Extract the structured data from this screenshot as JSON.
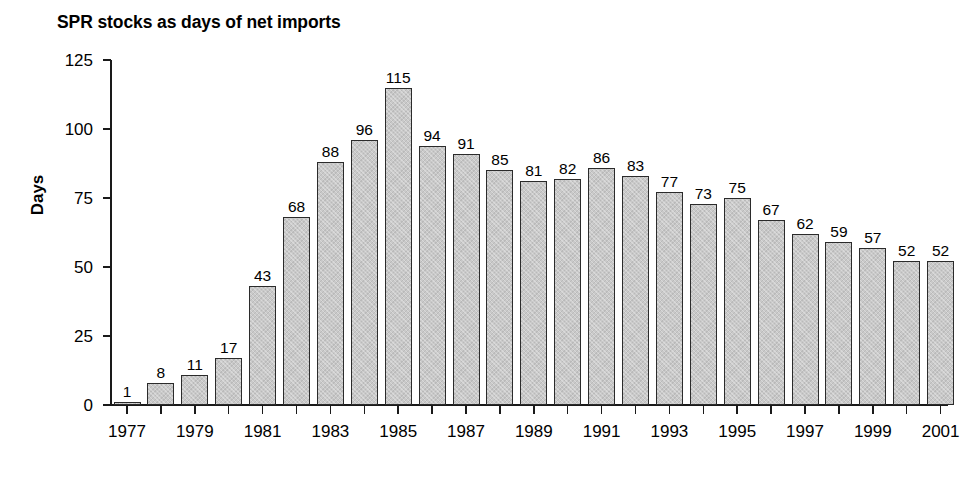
{
  "chart_data": {
    "type": "bar",
    "title": "SPR stocks as days of net imports",
    "xlabel": "",
    "ylabel": "Days",
    "ylim": [
      0,
      125
    ],
    "yticks": [
      0,
      25,
      50,
      75,
      100,
      125
    ],
    "grid": false,
    "legend": null,
    "show_value_labels": true,
    "categories": [
      "1977",
      "1978",
      "1979",
      "1980",
      "1981",
      "1982",
      "1983",
      "1984",
      "1985",
      "1986",
      "1987",
      "1988",
      "1989",
      "1990",
      "1991",
      "1992",
      "1993",
      "1994",
      "1995",
      "1996",
      "1997",
      "1998",
      "1999",
      "2000",
      "2001"
    ],
    "xtick_labels": [
      "1977",
      "1979",
      "1981",
      "1983",
      "1985",
      "1987",
      "1989",
      "1991",
      "1993",
      "1995",
      "1997",
      "1999",
      "2001"
    ],
    "values": [
      1,
      8,
      11,
      17,
      43,
      68,
      88,
      96,
      115,
      94,
      91,
      85,
      81,
      82,
      86,
      83,
      77,
      73,
      75,
      67,
      62,
      59,
      57,
      52,
      52
    ],
    "bar_color": "#c9c9c9",
    "bar_edge_color": "#2b2b2b",
    "axis_color": "#1a1a1a",
    "background_color": "#ffffff"
  }
}
